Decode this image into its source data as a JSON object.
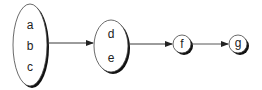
{
  "diagram": {
    "type": "set-mapping chain",
    "colors": {
      "stroke": "#222222",
      "shadow": "#111111",
      "fill": "#ffffff"
    },
    "nodes": [
      {
        "id": "set1",
        "shape": "ellipse",
        "elements": [
          "a",
          "b",
          "c"
        ]
      },
      {
        "id": "set2",
        "shape": "ellipse",
        "elements": [
          "d",
          "e"
        ]
      },
      {
        "id": "set3",
        "shape": "circle",
        "elements": [
          "f"
        ]
      },
      {
        "id": "set4",
        "shape": "circle",
        "elements": [
          "g"
        ]
      }
    ],
    "edges": [
      {
        "from": "set1",
        "to": "set2"
      },
      {
        "from": "set2",
        "to": "set3"
      },
      {
        "from": "set3",
        "to": "set4"
      }
    ]
  }
}
